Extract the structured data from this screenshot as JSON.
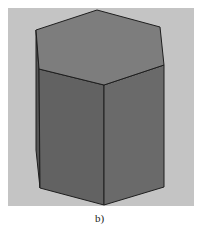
{
  "figure": {
    "caption": "b)",
    "colors": {
      "background": "#ffffff",
      "panel": "#c4c4c4",
      "top_face": "#7d7d7d",
      "left_face": "#626262",
      "right_face": "#6a6a6a",
      "back_sliver": "#565656",
      "edge": "#1e1e1e"
    }
  }
}
